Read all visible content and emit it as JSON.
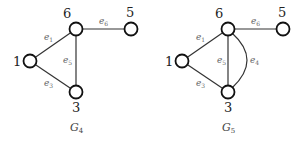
{
  "graphs": [
    {
      "id": "G4",
      "caption": {
        "main": "G",
        "sub": "4"
      },
      "nodes": [
        {
          "id": "1",
          "label": "1",
          "x": 30,
          "y": 61
        },
        {
          "id": "6",
          "label": "6",
          "x": 76,
          "y": 29
        },
        {
          "id": "5",
          "label": "5",
          "x": 131,
          "y": 29
        },
        {
          "id": "3",
          "label": "3",
          "x": 76,
          "y": 92
        }
      ],
      "edges": [
        {
          "id": "e1",
          "from": "1",
          "to": "6",
          "label": {
            "main": "e",
            "sub": "1"
          }
        },
        {
          "id": "e3",
          "from": "1",
          "to": "3",
          "label": {
            "main": "e",
            "sub": "3"
          }
        },
        {
          "id": "e5",
          "from": "6",
          "to": "3",
          "label": {
            "main": "e",
            "sub": "5"
          }
        },
        {
          "id": "e6",
          "from": "6",
          "to": "5",
          "label": {
            "main": "e",
            "sub": "6"
          }
        }
      ]
    },
    {
      "id": "G5",
      "caption": {
        "main": "G",
        "sub": "5"
      },
      "nodes": [
        {
          "id": "1",
          "label": "1",
          "x": 182,
          "y": 61
        },
        {
          "id": "6",
          "label": "6",
          "x": 228,
          "y": 29
        },
        {
          "id": "5",
          "label": "5",
          "x": 283,
          "y": 29
        },
        {
          "id": "3",
          "label": "3",
          "x": 228,
          "y": 92
        }
      ],
      "edges": [
        {
          "id": "e1",
          "from": "1",
          "to": "6",
          "label": {
            "main": "e",
            "sub": "1"
          }
        },
        {
          "id": "e3",
          "from": "1",
          "to": "3",
          "label": {
            "main": "e",
            "sub": "3"
          }
        },
        {
          "id": "e5",
          "from": "6",
          "to": "3",
          "label": {
            "main": "e",
            "sub": "5"
          }
        },
        {
          "id": "e6",
          "from": "6",
          "to": "5",
          "label": {
            "main": "e",
            "sub": "6"
          }
        },
        {
          "id": "e4",
          "from": "6",
          "to": "3",
          "curved": true,
          "label": {
            "main": "e",
            "sub": "4"
          }
        }
      ]
    }
  ]
}
